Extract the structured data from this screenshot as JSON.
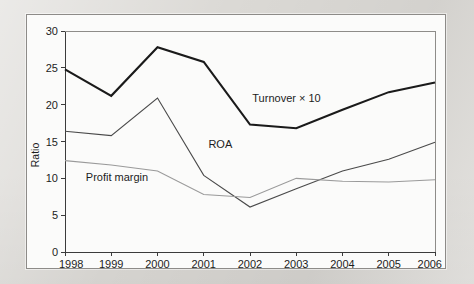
{
  "figure": {
    "panel_background": "#fbfbfa",
    "page_background": "#d9d7d3"
  },
  "chart_data": {
    "type": "line",
    "title": "",
    "subtitle": "",
    "xlabel": "",
    "ylabel": "Ratio",
    "x": [
      1998,
      1999,
      2000,
      2001,
      2002,
      2003,
      2004,
      2005,
      2006
    ],
    "categories": [
      "1998",
      "1999",
      "2000",
      "2001",
      "2002",
      "2003",
      "2004",
      "2005",
      "2006"
    ],
    "xlim": [
      1998,
      2006
    ],
    "ylim": [
      0,
      30
    ],
    "yticks": [
      0,
      5,
      10,
      15,
      20,
      25,
      30
    ],
    "ytick_labels": [
      "0",
      "5",
      "10",
      "15",
      "20",
      "25",
      "30"
    ],
    "xticks": [
      1998,
      1999,
      2000,
      2001,
      2002,
      2003,
      2004,
      2005,
      2006
    ],
    "xtick_labels": [
      "1998",
      "1999",
      "2000",
      "2001",
      "2002",
      "2003",
      "2004",
      "2005",
      "2006"
    ],
    "grid": false,
    "legend": "inline-annotations",
    "series": [
      {
        "name": "Turnover × 10",
        "label": "Turnover × 10",
        "color": "#1a1a1a",
        "width": 2.1,
        "values": [
          24.8,
          21.2,
          27.8,
          25.8,
          17.3,
          16.8,
          19.3,
          21.7,
          23.0
        ]
      },
      {
        "name": "ROA",
        "label": "ROA",
        "color": "#4a4a4a",
        "width": 1.1,
        "values": [
          16.4,
          15.8,
          20.9,
          10.4,
          6.1,
          8.6,
          11.0,
          12.6,
          14.9
        ]
      },
      {
        "name": "Profit margin",
        "label": "Profit margin",
        "color": "#9a9a9a",
        "width": 1.1,
        "values": [
          12.4,
          11.8,
          11.0,
          7.8,
          7.4,
          10.0,
          9.6,
          9.5,
          9.8
        ]
      }
    ],
    "annotations": [
      {
        "text": "Turnover × 10",
        "x": 2002.05,
        "y": 20.4,
        "anchor": "start"
      },
      {
        "text": "ROA",
        "x": 2001.1,
        "y": 14.1,
        "anchor": "start"
      },
      {
        "text": "Profit margin",
        "x": 1998.45,
        "y": 9.6,
        "anchor": "start"
      }
    ]
  }
}
